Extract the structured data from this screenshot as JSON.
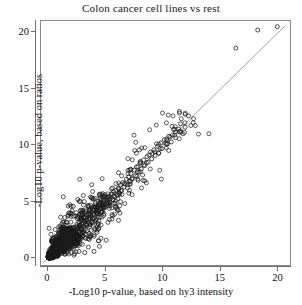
{
  "chart_data": {
    "type": "scatter",
    "title": "Colon cancer cell lines vs rest",
    "xlabel": "-Log10 p-value, based on hy3 intensity",
    "ylabel": "-Log10 p-value, based on ratios",
    "xlim": [
      -0.6,
      21.0
    ],
    "ylim": [
      -0.6,
      21.0
    ],
    "xticks": [
      0,
      5,
      10,
      15,
      20
    ],
    "yticks": [
      0,
      5,
      10,
      15,
      20
    ],
    "xtick_labels": [
      "0",
      "5",
      "10",
      "15",
      "20"
    ],
    "ytick_labels": [
      "0",
      "5",
      "10",
      "15",
      "20"
    ],
    "grid": false,
    "legend": null,
    "marker": "open-circle",
    "marker_size": 4,
    "marker_color": "#1a1a1a",
    "reference_line": {
      "name": "identity-line",
      "type": "linear",
      "slope": 1.0,
      "intercept": 0.0,
      "color": "#9a9a9a",
      "x_from": -0.4,
      "x_to": 20.6
    },
    "series": [
      {
        "name": "genes",
        "points": [
          [
            19.9,
            20.5
          ],
          [
            18.2,
            20.2
          ],
          [
            16.3,
            18.6
          ],
          [
            12.2,
            12.6
          ],
          [
            11.9,
            11.6
          ],
          [
            11.5,
            11.9
          ],
          [
            11.4,
            11.2
          ],
          [
            11.0,
            10.9
          ],
          [
            10.9,
            11.4
          ],
          [
            10.7,
            10.3
          ],
          [
            10.5,
            10.8
          ],
          [
            10.3,
            10.1
          ],
          [
            10.1,
            10.5
          ],
          [
            9.9,
            9.7
          ],
          [
            9.8,
            10.2
          ],
          [
            9.6,
            9.3
          ],
          [
            9.5,
            9.9
          ],
          [
            9.3,
            9.1
          ],
          [
            9.2,
            9.6
          ],
          [
            9.0,
            8.8
          ],
          [
            8.9,
            9.4
          ],
          [
            8.7,
            8.5
          ],
          [
            8.6,
            9.0
          ],
          [
            8.4,
            8.2
          ],
          [
            8.3,
            8.7
          ],
          [
            8.1,
            7.9
          ],
          [
            8.0,
            8.4
          ],
          [
            7.9,
            7.6
          ],
          [
            7.8,
            8.1
          ],
          [
            7.6,
            7.3
          ],
          [
            7.5,
            7.8
          ],
          [
            7.3,
            7.0
          ],
          [
            7.2,
            7.5
          ],
          [
            7.1,
            6.8
          ],
          [
            7.0,
            7.2
          ],
          [
            6.9,
            6.5
          ],
          [
            6.8,
            7.0
          ],
          [
            6.6,
            6.3
          ],
          [
            6.5,
            6.7
          ],
          [
            6.4,
            6.0
          ],
          [
            6.3,
            6.5
          ],
          [
            6.2,
            5.8
          ],
          [
            6.1,
            6.2
          ],
          [
            6.0,
            5.6
          ],
          [
            5.9,
            6.0
          ],
          [
            5.8,
            5.4
          ],
          [
            5.7,
            5.9
          ],
          [
            5.6,
            5.2
          ],
          [
            5.5,
            5.7
          ],
          [
            5.4,
            5.0
          ],
          [
            5.3,
            5.5
          ],
          [
            5.2,
            4.9
          ],
          [
            5.1,
            5.3
          ],
          [
            5.0,
            4.7
          ],
          [
            4.9,
            5.1
          ],
          [
            4.8,
            4.5
          ],
          [
            4.7,
            4.9
          ],
          [
            4.6,
            4.4
          ],
          [
            4.5,
            4.8
          ],
          [
            4.4,
            4.2
          ],
          [
            4.3,
            4.6
          ],
          [
            4.2,
            4.0
          ],
          [
            4.1,
            4.5
          ],
          [
            4.0,
            3.9
          ],
          [
            3.9,
            4.3
          ],
          [
            3.8,
            3.7
          ],
          [
            3.7,
            4.1
          ],
          [
            3.6,
            3.5
          ],
          [
            3.5,
            3.9
          ],
          [
            3.4,
            3.4
          ],
          [
            3.3,
            3.8
          ],
          [
            3.2,
            3.2
          ],
          [
            3.1,
            3.6
          ],
          [
            3.0,
            3.0
          ],
          [
            2.9,
            3.4
          ],
          [
            2.8,
            2.9
          ],
          [
            2.7,
            3.2
          ],
          [
            2.6,
            2.7
          ],
          [
            2.5,
            3.0
          ],
          [
            4.0,
            0.6
          ],
          [
            3.2,
            0.5
          ],
          [
            2.7,
            0.6
          ],
          [
            2.3,
            0.4
          ],
          [
            3.6,
            2.2
          ],
          [
            3.0,
            1.9
          ],
          [
            2.4,
            1.6
          ],
          [
            2.8,
            1.3
          ],
          [
            2.0,
            3.7
          ],
          [
            1.6,
            3.2
          ],
          [
            1.3,
            2.7
          ],
          [
            1.1,
            2.3
          ],
          [
            2.2,
            4.6
          ],
          [
            1.8,
            4.0
          ],
          [
            2.6,
            5.2
          ],
          [
            2.1,
            4.2
          ],
          [
            1.5,
            1.2
          ],
          [
            1.2,
            1.5
          ],
          [
            0.9,
            1.0
          ],
          [
            1.4,
            0.8
          ],
          [
            0.7,
            0.9
          ],
          [
            0.5,
            0.6
          ],
          [
            0.4,
            0.4
          ],
          [
            0.3,
            0.5
          ],
          [
            0.2,
            0.3
          ],
          [
            0.6,
            0.2
          ],
          [
            0.8,
            0.4
          ],
          [
            1.0,
            0.7
          ],
          [
            2.3,
            2.5
          ],
          [
            2.0,
            2.2
          ],
          [
            1.7,
            1.9
          ],
          [
            1.9,
            2.6
          ],
          [
            1.6,
            2.0
          ],
          [
            1.4,
            1.7
          ],
          [
            1.1,
            1.4
          ],
          [
            1.3,
            1.1
          ],
          [
            0.9,
            1.3
          ],
          [
            0.7,
            1.1
          ],
          [
            0.5,
            0.9
          ],
          [
            0.6,
            1.2
          ]
        ],
        "n_points": 2400,
        "density_note": "dense saturated cluster near origin"
      }
    ]
  }
}
